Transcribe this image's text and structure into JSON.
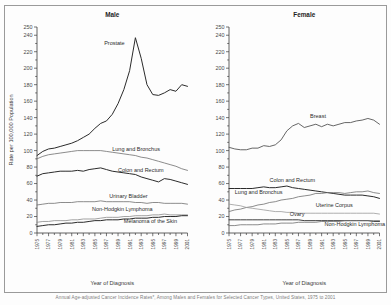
{
  "figure": {
    "caption": "Annual Age-adjusted Cancer Incidence Rates*, Among Males and Females for Selected Cancer Types, United States, 1975 to 2001"
  },
  "axis": {
    "xlabel": "Year of Diagnosis",
    "ylabel": "Rate per 100,000 Population",
    "yticks": [
      "0",
      "20",
      "40",
      "60",
      "80",
      "100",
      "120",
      "140",
      "160",
      "180",
      "200",
      "220",
      "240",
      "250"
    ],
    "xticks": [
      "1975",
      "1977",
      "1979",
      "1981",
      "1983",
      "1985",
      "1987",
      "1989",
      "1991",
      "1993",
      "1995",
      "1997",
      "1999",
      "2001"
    ]
  },
  "chart_data": [
    {
      "type": "line",
      "title": "Male",
      "xlabel": "Year of Diagnosis",
      "ylabel": "Rate per 100,000 Population",
      "xlim": [
        1975,
        2001
      ],
      "ylim": [
        0,
        250
      ],
      "ytick_step": 20,
      "grid": false,
      "legend": "inline-labels",
      "x": [
        1975,
        1976,
        1977,
        1978,
        1979,
        1980,
        1981,
        1982,
        1983,
        1984,
        1985,
        1986,
        1987,
        1988,
        1989,
        1990,
        1991,
        1992,
        1993,
        1994,
        1995,
        1996,
        1997,
        1998,
        1999,
        2000,
        2001
      ],
      "series": [
        {
          "name": "Prostate",
          "label": "Prostate",
          "color": "#2b2b2b",
          "width": 1.0,
          "label_x": 1986.6,
          "label_y": 228,
          "values": [
            94,
            99,
            102,
            103,
            105,
            107,
            109,
            112,
            116,
            120,
            127,
            133,
            136,
            144,
            157,
            174,
            197,
            237,
            212,
            180,
            168,
            167,
            170,
            174,
            172,
            180,
            178
          ]
        },
        {
          "name": "Lung and Bronchus",
          "label": "Lung and Bronchus",
          "color": "#6e6e6e",
          "width": 0.8,
          "label_x": 1988.0,
          "label_y": 99,
          "values": [
            90,
            93,
            95,
            96,
            97,
            98,
            99,
            100,
            100,
            100,
            100,
            100,
            99,
            98,
            97,
            96,
            95,
            94,
            92,
            91,
            89,
            87,
            85,
            83,
            81,
            78,
            76
          ]
        },
        {
          "name": "Colon and Rectum",
          "label": "Colon and Rectum",
          "color": "#2b2b2b",
          "width": 1.0,
          "label_x": 1989.0,
          "label_y": 74,
          "values": [
            69,
            72,
            73,
            74,
            75,
            75,
            75,
            76,
            75,
            77,
            78,
            79,
            77,
            75,
            74,
            73,
            72,
            71,
            68,
            66,
            64,
            62,
            66,
            65,
            63,
            61,
            59
          ]
        },
        {
          "name": "Urinary Bladder",
          "label": "Urinary Bladder",
          "color": "#6e6e6e",
          "width": 0.8,
          "label_x": 1987.5,
          "label_y": 42,
          "values": [
            34,
            35,
            36,
            36,
            37,
            37,
            37,
            38,
            38,
            38,
            38,
            39,
            38,
            38,
            38,
            38,
            38,
            37,
            37,
            36,
            37,
            37,
            36,
            36,
            36,
            36,
            35
          ]
        },
        {
          "name": "Non-Hodgkin Lymphoma",
          "label": "Non-Hodgkin Lymphoma",
          "color": "#8a8a8a",
          "width": 0.8,
          "label_x": 1984.5,
          "label_y": 27,
          "values": [
            13,
            14,
            14,
            15,
            15,
            15,
            16,
            16,
            17,
            17,
            17,
            18,
            19,
            19,
            19,
            20,
            20,
            21,
            21,
            21,
            22,
            22,
            23,
            22,
            22,
            22,
            22
          ]
        },
        {
          "name": "Melanoma of the Skin",
          "label": "Melanoma of the Skin",
          "color": "#2b2b2b",
          "width": 1.0,
          "label_x": 1990.0,
          "label_y": 12,
          "values": [
            8,
            9,
            10,
            10,
            11,
            12,
            12,
            13,
            13,
            14,
            15,
            15,
            16,
            16,
            16,
            17,
            17,
            18,
            18,
            18,
            19,
            19,
            20,
            20,
            20,
            21,
            21
          ]
        }
      ]
    },
    {
      "type": "line",
      "title": "Female",
      "xlabel": "Year of Diagnosis",
      "ylabel": "Rate per 100,000 Population",
      "xlim": [
        1975,
        2001
      ],
      "ylim": [
        0,
        250
      ],
      "ytick_step": 20,
      "grid": false,
      "legend": "inline-labels",
      "x": [
        1975,
        1976,
        1977,
        1978,
        1979,
        1980,
        1981,
        1982,
        1983,
        1984,
        1985,
        1986,
        1987,
        1988,
        1989,
        1990,
        1991,
        1992,
        1993,
        1994,
        1995,
        1996,
        1997,
        1998,
        1999,
        2000,
        2001
      ],
      "series": [
        {
          "name": "Breast",
          "label": "Breast",
          "color": "#555555",
          "width": 0.9,
          "label_x": 1989.0,
          "label_y": 140,
          "values": [
            104,
            102,
            101,
            101,
            103,
            103,
            106,
            105,
            107,
            113,
            124,
            130,
            133,
            128,
            130,
            132,
            129,
            132,
            130,
            132,
            134,
            134,
            136,
            137,
            139,
            137,
            132
          ]
        },
        {
          "name": "Colon and Rectum",
          "label": "Colon and Rectum",
          "color": "#2b2b2b",
          "width": 1.0,
          "label_x": 1982.0,
          "label_y": 62,
          "values": [
            54,
            54,
            54,
            54,
            54,
            55,
            56,
            55,
            55,
            56,
            57,
            55,
            54,
            53,
            52,
            51,
            50,
            49,
            48,
            47,
            46,
            46,
            46,
            46,
            45,
            44,
            42
          ]
        },
        {
          "name": "Lung and Bronchus",
          "label": "Lung and Bronchus",
          "color": "#6e6e6e",
          "width": 0.8,
          "label_x": 1976.0,
          "label_y": 47,
          "values": [
            26,
            28,
            29,
            31,
            32,
            34,
            35,
            37,
            38,
            40,
            41,
            42,
            44,
            45,
            46,
            48,
            48,
            49,
            49,
            49,
            48,
            49,
            50,
            50,
            51,
            49,
            48
          ]
        },
        {
          "name": "Uterine Corpus",
          "label": "Uterine Corpus",
          "color": "#9a9a9a",
          "width": 0.8,
          "label_x": 1990.0,
          "label_y": 32,
          "values": [
            35,
            34,
            33,
            31,
            30,
            29,
            28,
            27,
            26,
            26,
            25,
            25,
            24,
            24,
            24,
            24,
            24,
            24,
            24,
            24,
            24,
            24,
            24,
            24,
            24,
            24,
            23
          ]
        },
        {
          "name": "Ovary",
          "label": "Ovary",
          "color": "#2b2b2b",
          "width": 0.9,
          "label_x": 1985.5,
          "label_y": 21,
          "values": [
            16,
            16,
            16,
            16,
            16,
            16,
            16,
            16,
            16,
            16,
            16,
            16,
            16,
            15,
            15,
            15,
            15,
            15,
            15,
            15,
            15,
            15,
            15,
            15,
            15,
            14,
            14
          ]
        },
        {
          "name": "Non-Hodgkin Lymphoma",
          "label": "Non-Hodgkin Lymphoma",
          "color": "#6e6e6e",
          "width": 0.8,
          "label_x": 1991.5,
          "label_y": 9,
          "values": [
            9,
            9,
            10,
            10,
            10,
            10,
            11,
            11,
            11,
            12,
            12,
            12,
            13,
            13,
            13,
            13,
            14,
            14,
            14,
            14,
            15,
            15,
            15,
            15,
            15,
            15,
            15
          ]
        }
      ]
    }
  ]
}
